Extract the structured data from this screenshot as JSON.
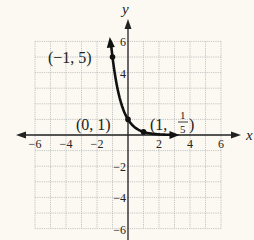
{
  "chart_data": {
    "type": "line",
    "title": "",
    "function": "y = (1/5)^x",
    "xlabel": "x",
    "ylabel": "y",
    "xlim": [
      -6,
      6
    ],
    "ylim": [
      -6,
      6
    ],
    "grid": true,
    "x_ticks": [
      -6,
      -4,
      -2,
      2,
      4,
      6
    ],
    "y_ticks": [
      6,
      4,
      -2,
      -4,
      -6
    ],
    "x_tick_labels": [
      "−6",
      "−4",
      "−2",
      "2",
      "4",
      "6"
    ],
    "y_tick_labels": [
      "6",
      "4",
      "−2",
      "−4",
      "−6"
    ],
    "curve_domain": [
      -1.11,
      3
    ],
    "points": [
      {
        "x": -1,
        "y": 5,
        "label": "(−1, 5)"
      },
      {
        "x": 0,
        "y": 1,
        "label": "(0, 1)"
      },
      {
        "x": 1,
        "y": 0.2,
        "label": "(1, 1/5)"
      }
    ],
    "colors": {
      "curve": "#111111",
      "grid": "#b8b8b8",
      "axis": "#222222",
      "background": "#fbf9f2"
    }
  },
  "labels": {
    "x_axis": "x",
    "y_axis": "y",
    "p1": "(−1, 5)",
    "p2": "(0, 1)",
    "p3_prefix": "(1,",
    "p3_num": "1",
    "p3_den": "5",
    "p3_suffix": ")"
  }
}
